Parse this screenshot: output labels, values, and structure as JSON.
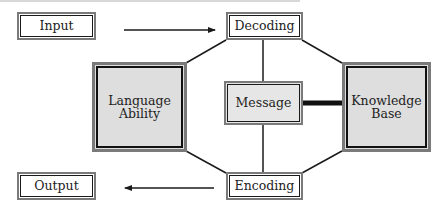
{
  "diagram": {
    "type": "communication model diagram",
    "nodes": {
      "input": {
        "label": "Input"
      },
      "output": {
        "label": "Output"
      },
      "decoding": {
        "label": "Decoding"
      },
      "encoding": {
        "label": "Encoding"
      },
      "language_ability": {
        "line1": "Language",
        "line2": "Ability"
      },
      "message": {
        "label": "Message"
      },
      "knowledge_base": {
        "line1": "Knowledge",
        "line2": "Base"
      }
    },
    "edges": [
      {
        "from": "Input",
        "to": "Decoding",
        "style": "arrow"
      },
      {
        "from": "Encoding",
        "to": "Output",
        "style": "arrow"
      },
      {
        "from": "Decoding",
        "to": "Language Ability",
        "style": "line"
      },
      {
        "from": "Decoding",
        "to": "Knowledge Base",
        "style": "line"
      },
      {
        "from": "Decoding",
        "to": "Message",
        "style": "line"
      },
      {
        "from": "Message",
        "to": "Encoding",
        "style": "line"
      },
      {
        "from": "Language Ability",
        "to": "Encoding",
        "style": "line"
      },
      {
        "from": "Knowledge Base",
        "to": "Encoding",
        "style": "line"
      },
      {
        "from": "Message",
        "to": "Knowledge Base",
        "style": "thick-line"
      }
    ],
    "colors": {
      "line": "#1a1a1a",
      "border_outer": "#7a7a7a",
      "fill_large": "#dedede",
      "fill_small": "#ffffff"
    }
  }
}
